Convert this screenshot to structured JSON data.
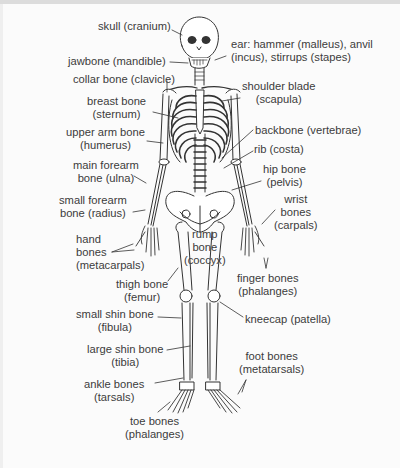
{
  "diagram": {
    "type": "labeled-skeleton",
    "labels": {
      "skull": "skull (cranium)",
      "jawbone": "jawbone (mandible)",
      "collar_bone": "collar bone (clavicle)",
      "breast_bone": [
        "breast bone",
        "(sternum)"
      ],
      "upper_arm_bone": [
        "upper arm bone",
        "(humerus)"
      ],
      "main_forearm_bone": [
        "main forearm",
        "bone (ulna)"
      ],
      "small_forearm_bone": [
        "small forearm",
        "bone (radius)"
      ],
      "hand_bones": [
        "hand",
        "bones",
        "(metacarpals)"
      ],
      "thigh_bone": [
        "thigh bone",
        "(femur)"
      ],
      "small_shin_bone": [
        "small shin bone",
        "(fibula)"
      ],
      "large_shin_bone": [
        "large shin bone",
        "(tibia)"
      ],
      "ankle_bones": [
        "ankle bones",
        "(tarsals)"
      ],
      "toe_bones": [
        "toe bones",
        "(phalanges)"
      ],
      "ear": [
        "ear: hammer (malleus), anvil",
        "(incus), stirrups (stapes)"
      ],
      "shoulder_blade": [
        "shoulder blade",
        "(scapula)"
      ],
      "backbone": "backbone (vertebrae)",
      "rib": "rib (costa)",
      "hip_bone": [
        "hip bone",
        "(pelvis)"
      ],
      "wrist_bones": [
        "wrist",
        "bones",
        "(carpals)"
      ],
      "rump_bone": [
        "rump",
        "bone",
        "(coccyx)"
      ],
      "finger_bones": [
        "finger bones",
        "(phalanges)"
      ],
      "kneecap": "kneecap (patella)",
      "foot_bones": [
        "foot bones",
        "(metatarsals)"
      ]
    }
  }
}
